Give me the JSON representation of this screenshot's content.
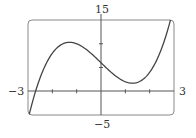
{
  "chart_data": {
    "type": "line",
    "title": "",
    "xlabel": "",
    "ylabel": "",
    "xlim": [
      -3,
      3
    ],
    "ylim": [
      -5,
      15
    ],
    "x_tick_labels": [
      "-3",
      "3"
    ],
    "y_tick_labels": [
      "-5",
      "15"
    ],
    "x_ticks": [
      -2,
      -1,
      1,
      2
    ],
    "y_ticks": [
      5,
      10
    ],
    "grid": false,
    "legend": null,
    "series": [
      {
        "name": "f(x)",
        "x": [
          -3,
          -2.65,
          -2,
          -1.29,
          -1,
          0,
          1,
          1.29,
          2,
          2.5,
          2.85
        ],
        "values": [
          -6,
          -2.4,
          8,
          10.3,
          10,
          6,
          2,
          1.7,
          4,
          9.1,
          15
        ]
      }
    ]
  },
  "labels": {
    "top": "15",
    "bottom": "−5",
    "left": "−3",
    "right": "3"
  },
  "colors": {
    "curve": "#444444",
    "frame": "#888888",
    "axes": "#555555"
  }
}
